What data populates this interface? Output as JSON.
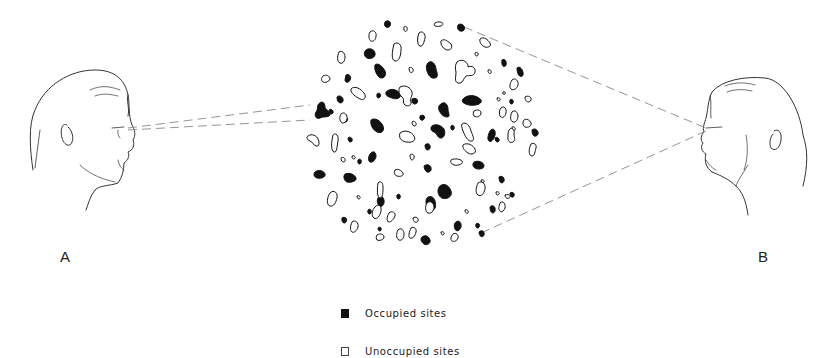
{
  "figure": {
    "observer_left": {
      "label": "A",
      "facing": "right"
    },
    "observer_right": {
      "label": "B",
      "facing": "left"
    },
    "cluster": {
      "description": "Circular cluster of irregular blob-shaped sites, some filled (occupied) and some outlined (unoccupied)"
    },
    "sight_lines": {
      "A": "Narrow pair of dashed lines from observer A's eye to a single occupied site at the left edge of the cluster",
      "B": "Wide pair of dashed lines from observer B's eye spanning the whole cluster"
    }
  },
  "legend": {
    "items": [
      {
        "label": "Occupied sites",
        "swatch": "filled",
        "color": "#111111"
      },
      {
        "label": "Unoccupied sites",
        "swatch": "empty",
        "color": "#ffffff"
      }
    ]
  },
  "colors": {
    "ink": "#111111",
    "line": "#555555",
    "dash": "#888888",
    "background": "#ffffff"
  }
}
